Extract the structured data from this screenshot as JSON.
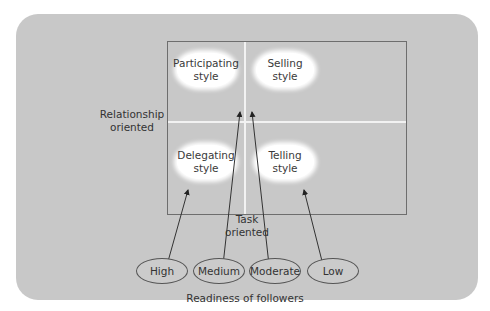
{
  "diagram": {
    "quadrants": [
      {
        "id": "participating",
        "line1": "Participating",
        "line2": "style"
      },
      {
        "id": "selling",
        "line1": "Selling",
        "line2": "style"
      },
      {
        "id": "delegating",
        "line1": "Delegating",
        "line2": "style"
      },
      {
        "id": "telling",
        "line1": "Telling",
        "line2": "style"
      }
    ],
    "axis_left": {
      "line1": "Relationship",
      "line2": "oriented"
    },
    "axis_bottom": {
      "line1": "Task",
      "line2": "oriented"
    },
    "readiness_levels": [
      {
        "label": "High",
        "points_to": "delegating"
      },
      {
        "label": "Medium",
        "points_to": "participating"
      },
      {
        "label": "Moderate",
        "points_to": "selling"
      },
      {
        "label": "Low",
        "points_to": "telling"
      }
    ],
    "caption": "Readiness of followers",
    "colors": {
      "background": "#c8c8c8",
      "cloud": "#ffffff",
      "lines": "#f2f2f2",
      "border": "#6e6e6e"
    }
  }
}
